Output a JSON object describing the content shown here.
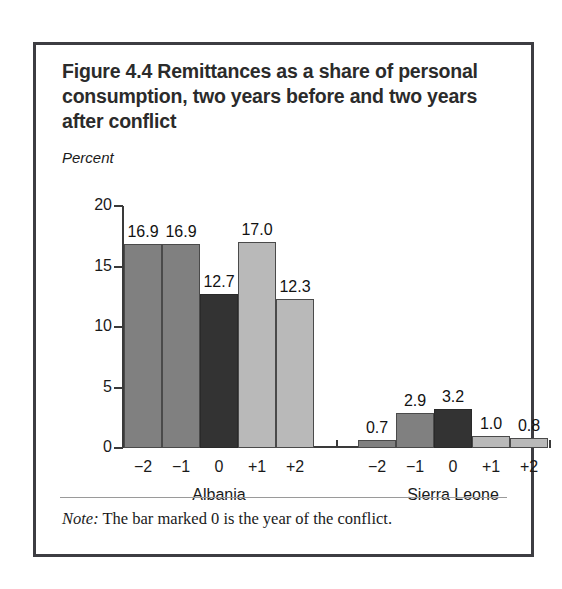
{
  "figure": {
    "title": "Figure 4.4  Remittances as a share of personal consumption, two years before and two years after conflict",
    "unit_label": "Percent",
    "note_word": "Note:",
    "note_text": " The bar marked 0 is the year of the conflict."
  },
  "colors": {
    "before": "#808080",
    "zero": "#333333",
    "after": "#b9b9b9",
    "axis": "#3a3a3a",
    "frame": "#3d3d42"
  },
  "chart_data": {
    "type": "bar",
    "title": "Figure 4.4  Remittances as a share of personal consumption, two years before and two years after conflict",
    "xlabel": "",
    "ylabel": "Percent",
    "ylim": [
      0,
      20
    ],
    "yticks": [
      0,
      5,
      10,
      15,
      20
    ],
    "ytick_labels": [
      "0",
      "5",
      "10",
      "15",
      "20"
    ],
    "grid": false,
    "legend": "none",
    "categories": [
      "−2",
      "−1",
      "0",
      "+1",
      "+2"
    ],
    "groups": [
      {
        "name": "Albania",
        "values": [
          16.9,
          16.9,
          12.7,
          17.0,
          12.3
        ],
        "value_labels": [
          "16.9",
          "16.9",
          "12.7",
          "17.0",
          "12.3"
        ],
        "shades": [
          "before",
          "before",
          "zero",
          "after",
          "after"
        ]
      },
      {
        "name": "Sierra Leone",
        "values": [
          0.7,
          2.9,
          3.2,
          1.0,
          0.8
        ],
        "value_labels": [
          "0.7",
          "2.9",
          "3.2",
          "1.0",
          "0.8"
        ],
        "shades": [
          "before",
          "before",
          "zero",
          "after",
          "after"
        ]
      }
    ],
    "note": "Note: The bar marked 0 is the year of the conflict."
  }
}
